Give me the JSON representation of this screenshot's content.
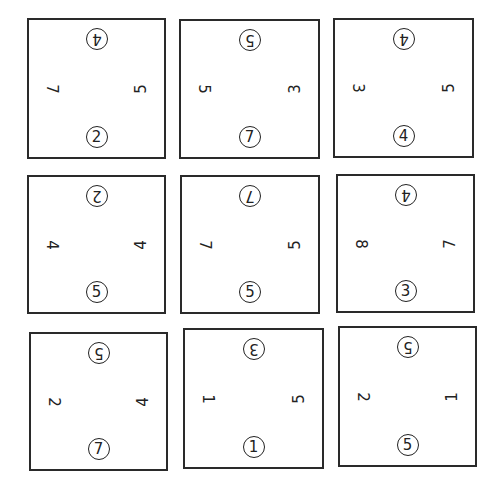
{
  "puzzle": {
    "tiles": [
      {
        "row": 0,
        "col": 0,
        "top": "4",
        "right": "5",
        "bottom": "2",
        "left": "7"
      },
      {
        "row": 0,
        "col": 1,
        "top": "5",
        "right": "3",
        "bottom": "7",
        "left": "5"
      },
      {
        "row": 0,
        "col": 2,
        "top": "4",
        "right": "5",
        "bottom": "4",
        "left": "3"
      },
      {
        "row": 1,
        "col": 0,
        "top": "2",
        "right": "4",
        "bottom": "5",
        "left": "4"
      },
      {
        "row": 1,
        "col": 1,
        "top": "7",
        "right": "5",
        "bottom": "5",
        "left": "7"
      },
      {
        "row": 1,
        "col": 2,
        "top": "4",
        "right": "7",
        "bottom": "3",
        "left": "8"
      },
      {
        "row": 2,
        "col": 0,
        "top": "5",
        "right": "4",
        "bottom": "7",
        "left": "2"
      },
      {
        "row": 2,
        "col": 1,
        "top": "3",
        "right": "5",
        "bottom": "1",
        "left": "1"
      },
      {
        "row": 2,
        "col": 2,
        "top": "5",
        "right": "1",
        "bottom": "5",
        "left": "2"
      }
    ],
    "colors": {
      "line": "#2a2a2a",
      "background": "#ffffff"
    }
  }
}
